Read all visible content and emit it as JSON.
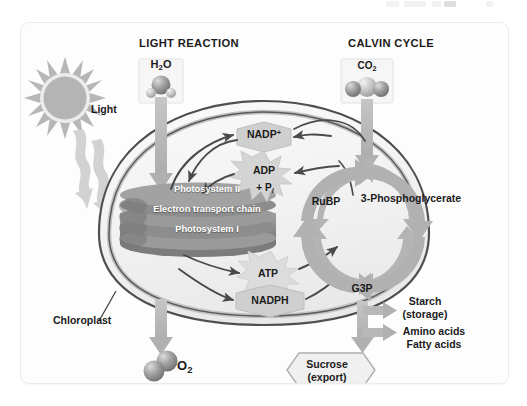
{
  "card": {
    "background": "#fdfdfd",
    "border_color": "#ececec"
  },
  "headings": {
    "light_reaction": "LIGHT REACTION",
    "calvin_cycle": "CALVIN CYCLE"
  },
  "inputs": {
    "water_label": "H",
    "water_sub": "2",
    "water_tail": "O",
    "co2_label": "CO",
    "co2_sub": "2",
    "light_label": "Light"
  },
  "outputs": {
    "oxygen_label": "O",
    "oxygen_sub": "2"
  },
  "organelle": {
    "name": "Chloroplast"
  },
  "thylakoid": {
    "layers": [
      "Photosystem II",
      "Electron transport chain",
      "Photosystem I"
    ]
  },
  "carriers": {
    "nadp_plus": "NADP",
    "nadp_plus_sup": "+",
    "adp": "ADP",
    "adp_phosphate": "+ P",
    "adp_phosphate_sub": "i",
    "atp": "ATP",
    "nadph": "NADPH"
  },
  "calvin": {
    "rubp": "RuBP",
    "three_pg": "3-Phosphoglycerate",
    "g3p": "G3P"
  },
  "products": {
    "starch_line1": "Starch",
    "starch_line2": "(storage)",
    "amino_acids": "Amino acids",
    "fatty_acids": "Fatty acids",
    "sucrose_line1": "Sucrose",
    "sucrose_line2": "(export)"
  },
  "colors": {
    "sun": "#b9b9b9",
    "thylakoid": "#8f8f8f",
    "arrow_gray": "#b3b3b3",
    "cycle_arrow": "#b0b0b0",
    "stroma": "#f2f2f2",
    "membrane": "#4a4a4a",
    "text": "#1b1b1b",
    "molecule_sphere": "#8a8a8a",
    "badge_fill": "#cfcfcf"
  }
}
